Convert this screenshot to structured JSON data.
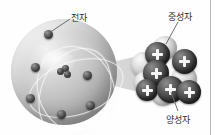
{
  "figure": {
    "background_color": "#fefefe",
    "width": 215,
    "height": 135
  },
  "labels": {
    "electron": "전자",
    "neutron": "중성자",
    "proton": "양성자"
  },
  "diagram": {
    "atom": {
      "name": "atom-sphere",
      "center": [
        64,
        72
      ],
      "radius": 53,
      "surface_color": "#c2c2c2",
      "orbit_count": 3,
      "electron_count": 6,
      "electrons": [
        {
          "x": 44,
          "y": 34
        },
        {
          "x": 34,
          "y": 65
        },
        {
          "x": 30,
          "y": 95
        },
        {
          "x": 59,
          "y": 110
        },
        {
          "x": 84,
          "y": 73
        },
        {
          "x": 88,
          "y": 104
        }
      ],
      "nucleus_cluster_count": 3
    },
    "magnified_nucleus": {
      "name": "nucleus-cluster",
      "proton_color": "#3a3a3a",
      "neutron_color": "#c3c3c3",
      "proton_symbol": "+",
      "particles": [
        {
          "type": "neutron",
          "x": 0,
          "y": 16,
          "size": 26
        },
        {
          "type": "neutron",
          "x": 3,
          "y": 35,
          "size": 24
        },
        {
          "type": "neutron",
          "x": 22,
          "y": 0,
          "size": 24
        },
        {
          "type": "neutron",
          "x": 40,
          "y": 30,
          "size": 26
        },
        {
          "type": "neutron",
          "x": 20,
          "y": 46,
          "size": 24
        },
        {
          "type": "proton",
          "x": 14,
          "y": 6,
          "size": 25
        },
        {
          "type": "proton",
          "x": 12,
          "y": 24,
          "size": 26
        },
        {
          "type": "proton",
          "x": 41,
          "y": 13,
          "size": 25
        },
        {
          "type": "proton",
          "x": 28,
          "y": 40,
          "size": 27
        },
        {
          "type": "proton",
          "x": 5,
          "y": 43,
          "size": 22
        },
        {
          "type": "proton",
          "x": 47,
          "y": 44,
          "size": 24
        }
      ]
    },
    "magnifier_cone": {
      "name": "magnification-cone",
      "color": "#d0d0d0"
    }
  },
  "leaders": {
    "electron_line": "from label 전자 down-left to electron on upper atom surface",
    "neutron_line": "from label 중성자 down-left to a light sphere in nucleus",
    "proton_line": "from label 양성자 up-left to a dark plus sphere in nucleus"
  }
}
